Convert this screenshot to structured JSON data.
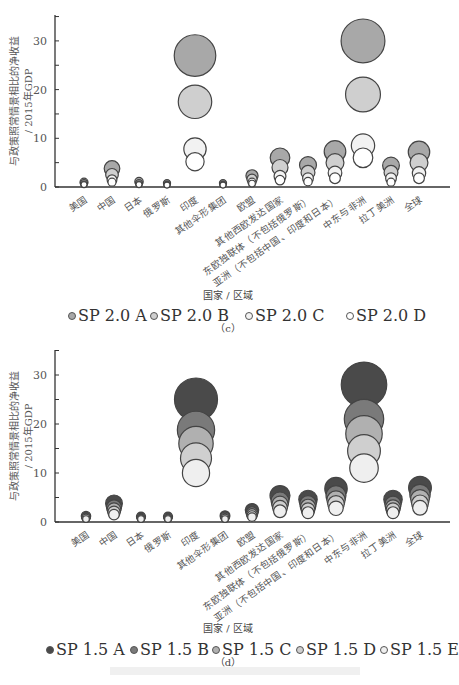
{
  "chart_data": [
    {
      "type": "scatter",
      "subtype": "bubble",
      "panel": "(c)",
      "ylabel": "与政策照常情景相比的净收益 / 2015年GDP",
      "xlabel": "国家 / 区域",
      "ylim": [
        0,
        35
      ],
      "yticks": [
        0,
        10,
        20,
        30
      ],
      "categories": [
        "美国",
        "中国",
        "日本",
        "俄罗斯",
        "印度",
        "其他伞形集团",
        "欧盟",
        "其他西欧发达国家",
        "东欧独联体（不包括俄罗斯）",
        "亚洲（不包括中国、印度和日本）",
        "中东与非洲",
        "拉丁美洲",
        "全球"
      ],
      "series": [
        {
          "name": "SP 2.0 A",
          "color": "#a8a8a8",
          "values": [
            1.0,
            3.8,
            1.1,
            0.8,
            27.0,
            0.8,
            2.3,
            6.0,
            4.5,
            7.3,
            30.0,
            4.4,
            7.2
          ]
        },
        {
          "name": "SP 2.0 B",
          "color": "#cfcfcf",
          "values": [
            0.8,
            2.5,
            0.8,
            0.6,
            17.5,
            0.6,
            1.6,
            4.0,
            3.0,
            5.0,
            19.0,
            3.0,
            5.0
          ]
        },
        {
          "name": "SP 2.0 C",
          "color": "#f2f2f2",
          "values": [
            0.6,
            1.5,
            0.6,
            0.5,
            7.8,
            0.5,
            1.0,
            2.2,
            1.8,
            2.9,
            8.5,
            1.8,
            2.8
          ]
        },
        {
          "name": "SP 2.0 D",
          "color": "#ffffff",
          "values": [
            0.5,
            1.0,
            0.5,
            0.4,
            5.2,
            0.4,
            0.7,
            1.4,
            1.1,
            1.8,
            6.0,
            1.0,
            1.8
          ]
        }
      ],
      "legend_position": "bottom"
    },
    {
      "type": "scatter",
      "subtype": "bubble",
      "panel": "(d)",
      "ylabel": "与政策照常情景相比的净收益 / 2015年GDP",
      "xlabel": "国家 / 区域",
      "ylim": [
        0,
        35
      ],
      "yticks": [
        0,
        10,
        20,
        30
      ],
      "categories": [
        "美国",
        "中国",
        "日本",
        "俄罗斯",
        "印度",
        "其他伞形集团",
        "欧盟",
        "其他西欧发达国家",
        "东欧独联体（不包括俄罗斯）",
        "亚洲（不包括中国、印度和日本）",
        "中东与非洲",
        "拉丁美洲",
        "全球"
      ],
      "series": [
        {
          "name": "SP 1.5 A",
          "color": "#4a4a4a",
          "values": [
            1.2,
            3.8,
            1.1,
            1.1,
            25.0,
            1.3,
            2.4,
            5.4,
            4.6,
            6.8,
            28.0,
            4.6,
            7.0
          ]
        },
        {
          "name": "SP 1.5 B",
          "color": "#7a7a7a",
          "values": [
            1.0,
            3.0,
            0.9,
            0.9,
            18.8,
            1.1,
            1.9,
            4.3,
            3.7,
            5.4,
            21.0,
            3.6,
            5.6
          ]
        },
        {
          "name": "SP 1.5 C",
          "color": "#b0b0b0",
          "values": [
            0.9,
            2.5,
            0.8,
            0.8,
            16.0,
            0.9,
            1.6,
            3.6,
            3.1,
            4.5,
            18.0,
            3.0,
            4.7
          ]
        },
        {
          "name": "SP 1.5 D",
          "color": "#cfcfcf",
          "values": [
            0.8,
            2.0,
            0.7,
            0.7,
            13.0,
            0.8,
            1.3,
            2.9,
            2.5,
            3.7,
            14.5,
            2.5,
            3.8
          ]
        },
        {
          "name": "SP 1.5 E",
          "color": "#efefef",
          "values": [
            0.6,
            1.5,
            0.6,
            0.6,
            10.0,
            0.6,
            1.0,
            2.2,
            1.9,
            2.8,
            11.0,
            1.9,
            2.9
          ]
        }
      ],
      "legend_position": "bottom"
    }
  ],
  "panels": {
    "c": {
      "ylabel_line1": "与政策照常情景相比的净收益",
      "ylabel_line2": "/ 2015年GDP",
      "yticks": [
        "0",
        "10",
        "20",
        "30"
      ],
      "xlabel": "国家 / 区域",
      "subtitle": "（c）",
      "legend": [
        "SP 2.0 A",
        "SP 2.0 B",
        "SP 2.0 C",
        "SP 2.0 D"
      ]
    },
    "d": {
      "ylabel_line1": "与政策照常情景相比的净收益",
      "ylabel_line2": "/ 2015年GDP",
      "yticks": [
        "0",
        "10",
        "20",
        "30"
      ],
      "xlabel": "国家 / 区域",
      "subtitle": "（d）",
      "legend": [
        "SP 1.5 A",
        "SP 1.5 B",
        "SP 1.5 C",
        "SP 1.5 D",
        "SP 1.5 E"
      ]
    }
  },
  "colors": {
    "axis": "#333333",
    "bubble_stroke": "#444444"
  }
}
